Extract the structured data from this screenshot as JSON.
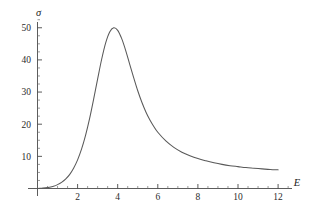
{
  "figure": {
    "background_color": "#ffffff",
    "curve_color": "#595959",
    "axis_color": "#4a4a4a",
    "text_color": "#2b2b2b"
  },
  "axes": {
    "x_axis_label": "E",
    "y_axis_label": "σ",
    "x_tick_labels": [
      "2",
      "4",
      "6",
      "8",
      "10",
      "12"
    ],
    "y_tick_labels": [
      "10",
      "20",
      "30",
      "40",
      "50"
    ]
  },
  "chart_data": {
    "type": "line",
    "title": "",
    "subtitle": "",
    "xlabel": "E",
    "ylabel": "σ",
    "xlim": [
      0,
      12.6
    ],
    "ylim": [
      0,
      53
    ],
    "grid": false,
    "legend": false,
    "legend_position": "none",
    "x_ticks": [
      2,
      4,
      6,
      8,
      10,
      12
    ],
    "y_ticks": [
      10,
      20,
      30,
      40,
      50
    ],
    "x_minor_tick_step": 0.5,
    "y_minor_tick_step": 2.5,
    "annotations": [],
    "series": [
      {
        "name": "cross-section",
        "color": "#595959",
        "x": [
          0.0,
          0.2,
          0.4,
          0.6,
          0.8,
          1.0,
          1.2,
          1.4,
          1.6,
          1.8,
          2.0,
          2.2,
          2.4,
          2.6,
          2.8,
          3.0,
          3.2,
          3.4,
          3.6,
          3.8,
          4.0,
          4.2,
          4.4,
          4.6,
          4.8,
          5.0,
          5.2,
          5.4,
          5.6,
          5.8,
          6.0,
          6.4,
          6.8,
          7.2,
          7.6,
          8.0,
          8.4,
          8.8,
          9.2,
          9.6,
          10.0,
          10.4,
          10.8,
          11.2,
          11.6,
          12.0
        ],
        "y": [
          0.0,
          0.1,
          0.2,
          0.4,
          0.7,
          1.2,
          1.9,
          2.9,
          4.3,
          6.3,
          8.9,
          12.3,
          16.6,
          21.8,
          27.8,
          34.1,
          40.2,
          45.3,
          48.7,
          50.0,
          49.2,
          46.6,
          42.9,
          38.6,
          34.4,
          30.4,
          26.9,
          23.9,
          21.4,
          19.3,
          17.5,
          14.8,
          12.8,
          11.3,
          10.2,
          9.3,
          8.6,
          8.0,
          7.5,
          7.1,
          6.8,
          6.5,
          6.3,
          6.1,
          5.9,
          5.8
        ]
      }
    ],
    "peak": {
      "x": 3.8,
      "y": 50.0
    },
    "endpoint": {
      "x": 12.0,
      "y": 5.8
    }
  }
}
